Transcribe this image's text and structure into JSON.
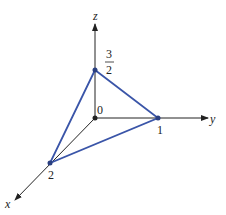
{
  "diagram": {
    "axes": {
      "x": "x",
      "y": "y",
      "z": "z"
    },
    "origin_label": "0",
    "points": {
      "x_intercept": "2",
      "y_intercept": "1",
      "z_intercept_num": "3",
      "z_intercept_den": "2"
    },
    "colors": {
      "triangle": "#3a55a8",
      "axis": "#222222"
    }
  }
}
